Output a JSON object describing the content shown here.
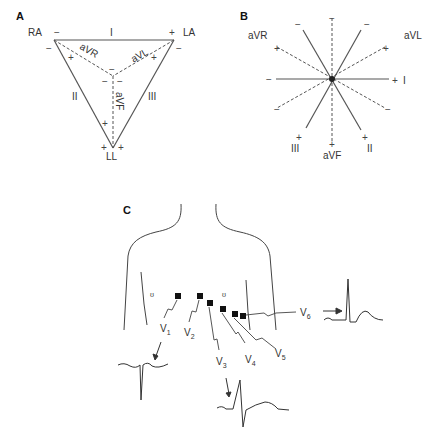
{
  "panels": {
    "A": {
      "label": "A",
      "vertices": {
        "ra": "RA",
        "la": "LA",
        "ll": "LL"
      },
      "leads": {
        "I": "I",
        "II": "II",
        "III": "III",
        "aVR": "aVR",
        "aVL": "aVL",
        "aVF": "aVF"
      },
      "signs": {
        "plus": "+",
        "minus": "−"
      }
    },
    "B": {
      "label": "B",
      "leads": {
        "I": "I",
        "II": "II",
        "III": "III",
        "aVR": "aVR",
        "aVL": "aVL",
        "aVF": "aVF"
      },
      "signs": {
        "plus": "+",
        "minus": "−"
      }
    },
    "C": {
      "label": "C",
      "electrodes": [
        {
          "label": "V",
          "sub": "1"
        },
        {
          "label": "V",
          "sub": "2"
        },
        {
          "label": "V",
          "sub": "3"
        },
        {
          "label": "V",
          "sub": "4"
        },
        {
          "label": "V",
          "sub": "5"
        },
        {
          "label": "V",
          "sub": "6"
        }
      ]
    }
  }
}
